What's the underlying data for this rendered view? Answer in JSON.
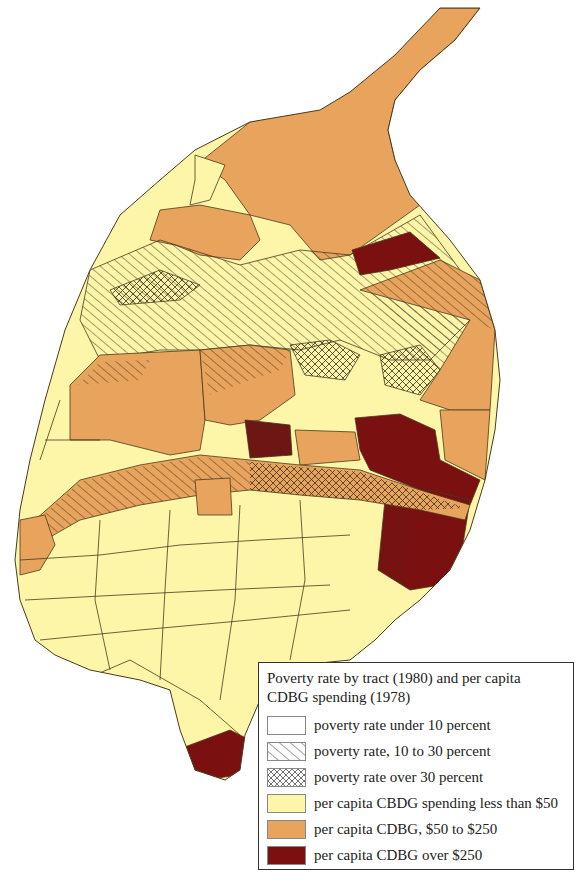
{
  "map": {
    "subject": "Census tracts, poverty rate and per capita CDBG spending",
    "colors": {
      "low_spending": "#fdf5a8",
      "mid_spending": "#e8a45c",
      "high_spending": "#7a1010",
      "outline": "#4a3a20",
      "hatch": "#3a3020"
    }
  },
  "legend": {
    "title": "Poverty rate by tract (1980) and per capita CDBG spending (1978)",
    "items": [
      {
        "label": "poverty rate under 10 percent",
        "swatch": "blank"
      },
      {
        "label": "poverty rate, 10 to 30 percent",
        "swatch": "single-hatch"
      },
      {
        "label": "poverty rate over 30 percent",
        "swatch": "cross-hatch"
      },
      {
        "label": "per capita CBDG spending less than $50",
        "swatch": "#fdf5a8"
      },
      {
        "label": "per capita CDBG, $50 to $250",
        "swatch": "#e8a45c"
      },
      {
        "label": "per capita CDBG over $250",
        "swatch": "#7a1010"
      }
    ]
  }
}
